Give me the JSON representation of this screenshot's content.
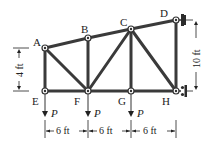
{
  "diagram": {
    "type": "truss",
    "nodes": {
      "A": {
        "label": "A",
        "x": 45,
        "y": 48
      },
      "B": {
        "label": "B",
        "x": 88,
        "y": 38
      },
      "C": {
        "label": "C",
        "x": 131,
        "y": 29
      },
      "D": {
        "label": "D",
        "x": 176,
        "y": 20
      },
      "E": {
        "label": "E",
        "x": 45,
        "y": 91
      },
      "F": {
        "label": "F",
        "x": 88,
        "y": 91
      },
      "G": {
        "label": "G",
        "x": 131,
        "y": 91
      },
      "H": {
        "label": "H",
        "x": 176,
        "y": 91
      }
    },
    "members": [
      [
        "A",
        "B"
      ],
      [
        "B",
        "C"
      ],
      [
        "C",
        "D"
      ],
      [
        "E",
        "F"
      ],
      [
        "F",
        "G"
      ],
      [
        "G",
        "H"
      ],
      [
        "A",
        "E"
      ],
      [
        "B",
        "F"
      ],
      [
        "C",
        "G"
      ],
      [
        "D",
        "H"
      ],
      [
        "A",
        "F"
      ],
      [
        "F",
        "C"
      ],
      [
        "C",
        "H"
      ]
    ],
    "loads": [
      {
        "at": "E",
        "label": "P"
      },
      {
        "at": "F",
        "label": "P"
      },
      {
        "at": "G",
        "label": "P"
      }
    ],
    "supports": [
      {
        "at": "D",
        "type": "wall-pin"
      },
      {
        "at": "H",
        "type": "wall-roller"
      }
    ],
    "dimensions": {
      "left_height": "4 ft",
      "right_height": "10 ft",
      "spans": [
        "6 ft",
        "6 ft",
        "6 ft"
      ]
    }
  }
}
